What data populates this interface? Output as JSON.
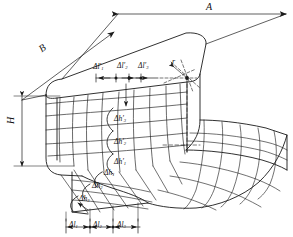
{
  "figure": {
    "type": "engineering-diagram",
    "background_color": "#ffffff",
    "line_color": "#1a1a1a"
  },
  "dimensions": {
    "length": {
      "symbol": "A",
      "name": "length-dimension",
      "position": "top"
    },
    "width": {
      "symbol": "B",
      "name": "width-dimension",
      "position": "upper-left-diagonal"
    },
    "height": {
      "symbol": "H",
      "name": "height-dimension",
      "position": "left"
    },
    "radius": {
      "symbol": "r",
      "name": "corner-radius",
      "position": "top-right-corner"
    }
  },
  "increments": {
    "top_horizontal": {
      "caption": "top-face horizontal increments",
      "items": [
        {
          "base": "Δl",
          "prime": true,
          "index": "1"
        },
        {
          "base": "Δl",
          "prime": true,
          "index": "2"
        },
        {
          "base": "Δl",
          "prime": true,
          "index": "3"
        }
      ]
    },
    "front_vertical": {
      "caption": "front-face vertical increments",
      "items": [
        {
          "base": "Δh",
          "prime": true,
          "index": "3"
        },
        {
          "base": "Δh",
          "prime": true,
          "index": "2"
        },
        {
          "base": "Δh",
          "prime": true,
          "index": "1"
        }
      ]
    },
    "bottom_diagonal": {
      "caption": "bottom-face diagonal increments",
      "items": [
        {
          "base": "Δh",
          "prime": false,
          "index": "1"
        },
        {
          "base": "Δh",
          "prime": false,
          "index": "2"
        },
        {
          "base": "Δh",
          "prime": false,
          "index": "3"
        }
      ]
    },
    "bottom_horizontal": {
      "caption": "bottom horizontal increments",
      "items": [
        {
          "base": "Δl",
          "prime": false,
          "index": "1"
        },
        {
          "base": "Δl",
          "prime": false,
          "index": "2"
        },
        {
          "base": "Δl",
          "prime": false,
          "index": "3"
        }
      ]
    }
  },
  "labels": {
    "A": "A",
    "B": "B",
    "H": "H",
    "r": "r",
    "dl1p": "Δl",
    "dl2p": "Δl",
    "dl3p": "Δl",
    "dh3p": "Δh",
    "dh2p": "Δh",
    "dh1p": "Δh",
    "dh1": "Δh",
    "dh2": "Δh",
    "dh3": "Δh",
    "dl1": "Δl",
    "dl2": "Δl",
    "dl3": "Δl",
    "i1": "1",
    "i2": "2",
    "i3": "3",
    "prime": "′"
  }
}
